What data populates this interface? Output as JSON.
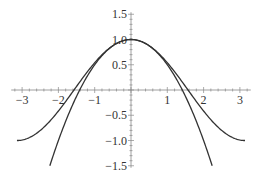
{
  "chart_data": {
    "type": "line",
    "title": "",
    "xlabel": "",
    "ylabel": "",
    "xlim": [
      -3.3,
      3.3
    ],
    "ylim": [
      -1.5,
      1.5
    ],
    "grid": false,
    "legend": null,
    "x_ticks": [
      -3,
      -2,
      -1,
      1,
      2,
      3
    ],
    "x_tick_labels": [
      "−3",
      "−2",
      "−1",
      "1",
      "2",
      "3"
    ],
    "y_ticks": [
      1.5,
      1.0,
      0.5,
      -0.5,
      -1.0,
      -1.5
    ],
    "y_tick_labels": [
      "1.5",
      "1.0",
      "0.5",
      "−0.5",
      "−1.0",
      "−1.5"
    ],
    "series": [
      {
        "name": "cos(x)",
        "domain": [
          -3.1416,
          3.1416
        ],
        "x": [
          -3.14,
          -2.5,
          -2,
          -1.5,
          -1,
          -0.5,
          0,
          0.5,
          1,
          1.5,
          2,
          2.5,
          3.14
        ],
        "values": [
          -1.0,
          -0.8,
          -0.42,
          0.07,
          0.54,
          0.88,
          1.0,
          0.88,
          0.54,
          0.07,
          -0.42,
          -0.8,
          -1.0
        ]
      },
      {
        "name": "1 - x^2/2",
        "domain": [
          -2.236,
          2.236
        ],
        "x": [
          -2.236,
          -2,
          -1.5,
          -1,
          -0.5,
          0,
          0.5,
          1,
          1.5,
          2,
          2.236
        ],
        "values": [
          -1.5,
          -1.0,
          -0.125,
          0.5,
          0.875,
          1.0,
          0.875,
          0.5,
          -0.125,
          -1.0,
          -1.5
        ]
      }
    ]
  }
}
